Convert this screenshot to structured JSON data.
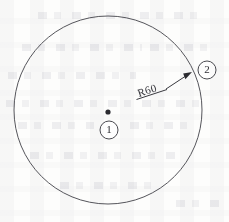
{
  "drawing": {
    "title": "Circle with radius dimension and item balloons",
    "background_color": "#fdfdfc",
    "ink_color": "#55555b",
    "main_circle": {
      "name": "outer-circle",
      "center_x": 108,
      "center_y": 110,
      "radius_px": 94
    },
    "center_point": {
      "name": "center-point-marker",
      "x": 108,
      "y": 112
    },
    "dimension": {
      "label": "R60",
      "value": 60,
      "prefix": "R",
      "leader_start_x": 168,
      "leader_start_y": 88,
      "arrow_tip_x": 191,
      "arrow_tip_y": 73,
      "text_x": 140,
      "text_y": 97,
      "text_rotation_deg": -24
    },
    "balloons": [
      {
        "id": "balloon-1",
        "label": "1",
        "cx": 109,
        "cy": 130,
        "r": 9,
        "refers_to": "center-point"
      },
      {
        "id": "balloon-2",
        "label": "2",
        "cx": 207,
        "cy": 70,
        "r": 9,
        "refers_to": "circle-edge"
      }
    ]
  }
}
